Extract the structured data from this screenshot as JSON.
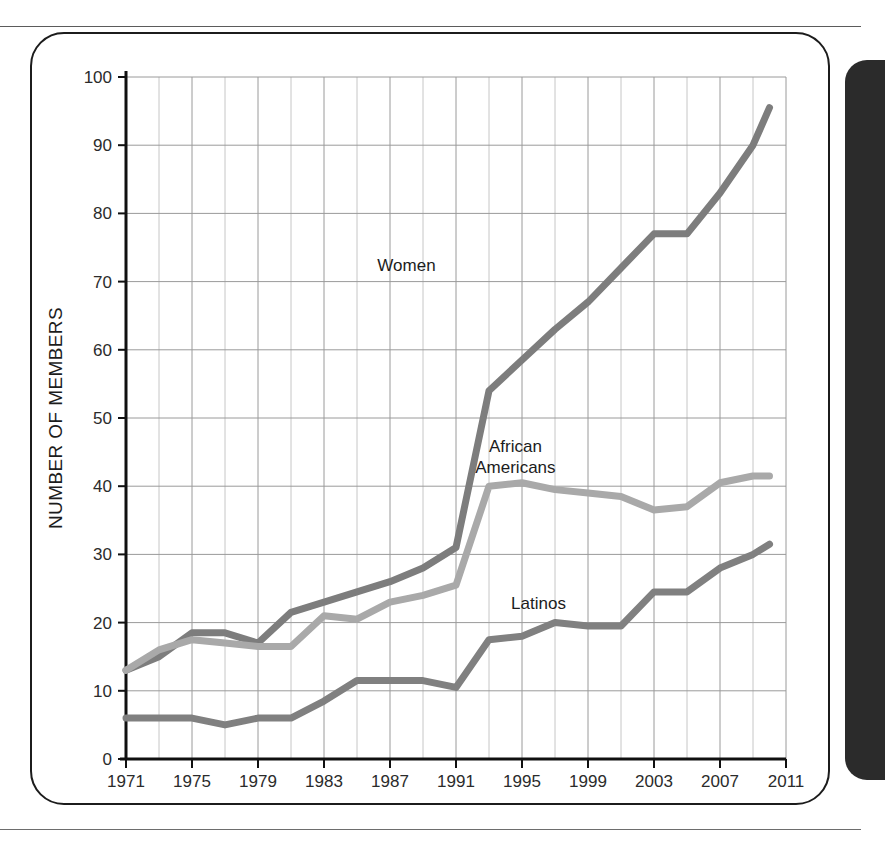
{
  "figure": {
    "frame_color": "#1c1c1c",
    "side_panel_color": "#2b2b2b"
  },
  "chart_data": {
    "type": "line",
    "title": "",
    "subtitle": "",
    "xlabel": "",
    "ylabel": "NUMBER OF MEMBERS",
    "xlim": [
      1971,
      2011
    ],
    "ylim": [
      0,
      100
    ],
    "grid": true,
    "legend_position": "inline-labels",
    "x_tick_labels": [
      "1971",
      "1975",
      "1979",
      "1983",
      "1987",
      "1991",
      "1995",
      "1999",
      "2003",
      "2007",
      "2011"
    ],
    "x_ticks": [
      1971,
      1975,
      1979,
      1983,
      1987,
      1991,
      1995,
      1999,
      2003,
      2007,
      2011
    ],
    "y_tick_labels": [
      "0",
      "10",
      "20",
      "30",
      "40",
      "50",
      "60",
      "70",
      "80",
      "90",
      "100"
    ],
    "y_ticks": [
      0,
      10,
      20,
      30,
      40,
      50,
      60,
      70,
      80,
      90,
      100
    ],
    "x": [
      1971,
      1973,
      1975,
      1977,
      1979,
      1981,
      1983,
      1985,
      1987,
      1989,
      1991,
      1993,
      1995,
      1997,
      1999,
      2001,
      2003,
      2005,
      2007,
      2009,
      2010
    ],
    "series": [
      {
        "name": "Women",
        "color": "#7d7d7d",
        "label": "Women",
        "label_x": 1988.0,
        "label_y": 71.5,
        "values": [
          13,
          15,
          18.5,
          18.5,
          17,
          21.5,
          23,
          24.5,
          26,
          28,
          31,
          54,
          58.5,
          63,
          67,
          72,
          77,
          77,
          83,
          90,
          95.5
        ]
      },
      {
        "name": "African Americans",
        "color": "#a9a9a9",
        "label": "African Americans",
        "label_x": 1994.6,
        "label_y": 45.0,
        "values": [
          13,
          16,
          17.5,
          17,
          16.5,
          16.5,
          21,
          20.5,
          23,
          24,
          25.5,
          40,
          40.5,
          39.5,
          39,
          38.5,
          36.5,
          37,
          40.5,
          41.5,
          41.5
        ]
      },
      {
        "name": "Latinos",
        "color": "#808080",
        "label": "Latinos",
        "label_x": 1996.0,
        "label_y": 22.0,
        "values": [
          6,
          6,
          6,
          5,
          6,
          6,
          8.5,
          11.5,
          11.5,
          11.5,
          10.5,
          17.5,
          18,
          20,
          19.5,
          19.5,
          24.5,
          24.5,
          28,
          30,
          31.5
        ]
      }
    ]
  }
}
